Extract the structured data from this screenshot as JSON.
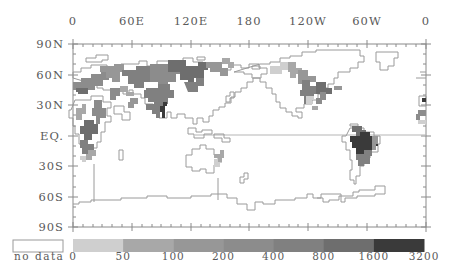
{
  "map": {
    "projection": "equirectangular, 0 to 360 longitude (Greenwich-centered left edge)",
    "frame": {
      "left": 73,
      "top": 44,
      "right": 426,
      "bottom": 227
    },
    "x_axis": {
      "position": "top",
      "ticks": [
        {
          "label": "0",
          "x": 73
        },
        {
          "label": "60E",
          "x": 132
        },
        {
          "label": "120E",
          "x": 191
        },
        {
          "label": "180",
          "x": 249
        },
        {
          "label": "120W",
          "x": 308
        },
        {
          "label": "60W",
          "x": 367
        },
        {
          "label": "0",
          "x": 426
        }
      ]
    },
    "y_axis": {
      "position": "left",
      "ticks": [
        {
          "label": "90N",
          "y": 44
        },
        {
          "label": "60N",
          "y": 75
        },
        {
          "label": "30N",
          "y": 105
        },
        {
          "label": "EQ.",
          "y": 136
        },
        {
          "label": "30S",
          "y": 166
        },
        {
          "label": "60S",
          "y": 197
        },
        {
          "label": "90S",
          "y": 227
        }
      ]
    },
    "colors": {
      "outline": "#9a9a9a",
      "frame": "#8a8a8a",
      "background": "#ffffff"
    }
  },
  "legend": {
    "no_data_label": "no data",
    "no_data_color": "#ffffff",
    "bins": [
      {
        "from": "0",
        "to": "50",
        "color": "#cfcfcf"
      },
      {
        "from": "50",
        "to": "100",
        "color": "#a8a8a8"
      },
      {
        "from": "100",
        "to": "200",
        "color": "#979797"
      },
      {
        "from": "200",
        "to": "400",
        "color": "#8c8c8c"
      },
      {
        "from": "400",
        "to": "800",
        "color": "#808080"
      },
      {
        "from": "800",
        "to": "1600",
        "color": "#6e6e6e"
      },
      {
        "from": "1600",
        "to": "3200",
        "color": "#3a3a3a"
      }
    ],
    "tick_labels": [
      "0",
      "50",
      "100",
      "200",
      "400",
      "800",
      "1600",
      "3200"
    ]
  },
  "chart_data": {
    "type": "heatmap",
    "title": "",
    "xlabel": "Longitude",
    "ylabel": "Latitude",
    "x_ticks": [
      "0",
      "60E",
      "120E",
      "180",
      "120W",
      "60W",
      "0"
    ],
    "y_ticks": [
      "90N",
      "60N",
      "30N",
      "EQ.",
      "30S",
      "60S",
      "90S"
    ],
    "legend_bins": [
      "no data",
      "0-50",
      "50-100",
      "100-200",
      "200-400",
      "400-800",
      "800-1600",
      "1600-3200"
    ],
    "regions": [
      {
        "name": "Amazon basin (South America)",
        "class": "1600-3200"
      },
      {
        "name": "Parana / La Plata (South America)",
        "class": "400-800"
      },
      {
        "name": "Orinoco (South America)",
        "class": "800-1600"
      },
      {
        "name": "Ganges-Brahmaputra (South Asia)",
        "class": "1600-3200"
      },
      {
        "name": "Yangtze / East Asia basins",
        "class": "400-800"
      },
      {
        "name": "Siberian basins (Ob, Yenisei, Lena)",
        "class": "200-800"
      },
      {
        "name": "European basins",
        "class": "100-400"
      },
      {
        "name": "Mississippi (North America)",
        "class": "400-800"
      },
      {
        "name": "Canadian / Alaskan basins",
        "class": "50-200"
      },
      {
        "name": "Congo (Africa)",
        "class": "800-1600"
      },
      {
        "name": "Zambezi / Southern Africa",
        "class": "100-200"
      },
      {
        "name": "Murray-Darling (Australia)",
        "class": "0-100"
      }
    ]
  }
}
